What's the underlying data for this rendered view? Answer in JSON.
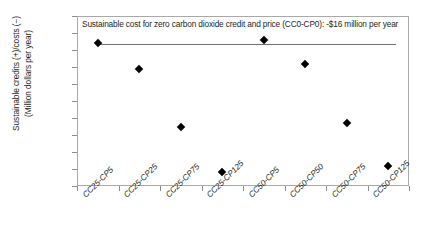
{
  "chart_data": {
    "type": "scatter",
    "title": "",
    "xlabel": "",
    "ylabel": "Sustainable credits (+)/costs (−) (Million dollars per year)",
    "ylabel_line1": "Sustainable credits (+)/costs (−)",
    "ylabel_line2": "(Million dollars per year)",
    "categories": [
      "CC25-CP5",
      "CC25-CP25",
      "CC25-CP75",
      "CC25-CP125",
      "CC50-CP5",
      "CC50-CP50",
      "CC50-CP75",
      "CC50-CP125"
    ],
    "values": [
      -16,
      -31,
      -65,
      -92,
      -14,
      -28,
      -63,
      -88
    ],
    "ylim": [
      -100,
      0
    ],
    "yticks": [
      0,
      -10,
      -20,
      -30,
      -40,
      -50,
      -60,
      -70,
      -80,
      -90,
      -100
    ],
    "ytick_labels": [
      "0",
      "−10",
      "−20",
      "−30",
      "−40",
      "−50",
      "−60",
      "−70",
      "−80",
      "−90",
      "−100"
    ],
    "grid": false,
    "legend": "none",
    "marker": "diamond",
    "marker_color": "#000000",
    "annotations": [
      {
        "text": "Sustainable cost for zero carbon dioxide credit and price (CC0-CP0): -$16 million per year",
        "y_value": -16,
        "reference_line": true,
        "line_color": "#6f6f6f"
      }
    ]
  }
}
